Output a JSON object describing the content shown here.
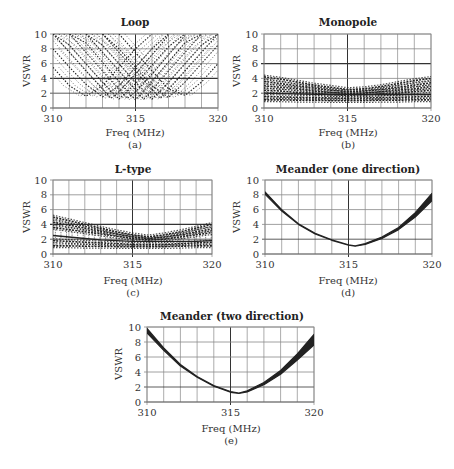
{
  "chart_data": [
    {
      "id": "a",
      "type": "line",
      "title": "Loop",
      "caption": "(a)",
      "xlabel": "Freq (MHz)",
      "ylabel": "VSWR",
      "xlim": [
        310,
        320
      ],
      "ylim": [
        0,
        10
      ],
      "xticks": [
        310,
        315,
        320
      ],
      "yticks": [
        0,
        2,
        4,
        6,
        8,
        10
      ],
      "grid": true,
      "style": "scatter-dashed",
      "description": "Many V-shaped VSWR curves with minima ~1-2 spread across 312-318 MHz, rising steeply to 10 at band edges",
      "series": [
        {
          "name": "min@312",
          "x": [
            310,
            311,
            312,
            313,
            314,
            315,
            316
          ],
          "y": [
            5.5,
            3.0,
            1.6,
            3.0,
            5.5,
            8.0,
            10
          ]
        },
        {
          "name": "min@313",
          "x": [
            310,
            311,
            312,
            313,
            314,
            315,
            316,
            317
          ],
          "y": [
            8.0,
            5.5,
            3.2,
            1.5,
            3.0,
            5.5,
            8.0,
            10
          ]
        },
        {
          "name": "min@313.5",
          "x": [
            310,
            311,
            312,
            313,
            313.5,
            314,
            315,
            316,
            317
          ],
          "y": [
            10,
            7.5,
            5.0,
            2.6,
            1.3,
            2.2,
            4.6,
            7.2,
            9.8
          ]
        },
        {
          "name": "min@314",
          "x": [
            310,
            311,
            312,
            313,
            314,
            315,
            316,
            317,
            318
          ],
          "y": [
            10,
            8.5,
            6.0,
            3.5,
            1.2,
            3.3,
            5.8,
            8.3,
            10
          ]
        },
        {
          "name": "min@314.5",
          "x": [
            311,
            312,
            313,
            314,
            314.5,
            315,
            316,
            317,
            318
          ],
          "y": [
            10,
            7.5,
            5.0,
            2.5,
            1.3,
            2.2,
            4.6,
            7.2,
            9.8
          ]
        },
        {
          "name": "min@315",
          "x": [
            311,
            312,
            313,
            314,
            315,
            316,
            317,
            318,
            319
          ],
          "y": [
            10,
            8.8,
            6.2,
            3.6,
            1.1,
            3.6,
            6.2,
            8.8,
            10
          ]
        },
        {
          "name": "min@315.5",
          "x": [
            312,
            313,
            314,
            315,
            315.5,
            316,
            317,
            318,
            319
          ],
          "y": [
            10,
            7.5,
            5.0,
            2.4,
            1.2,
            2.4,
            5.0,
            7.5,
            10
          ]
        },
        {
          "name": "min@316",
          "x": [
            312,
            313,
            314,
            315,
            316,
            317,
            318,
            319,
            320
          ],
          "y": [
            10,
            8.5,
            6.0,
            3.5,
            1.2,
            3.5,
            6.0,
            8.5,
            10
          ]
        },
        {
          "name": "min@316.5",
          "x": [
            313,
            314,
            315,
            316,
            316.5,
            317,
            318,
            319,
            320
          ],
          "y": [
            10,
            7.5,
            5.0,
            2.5,
            1.3,
            2.5,
            5.0,
            7.5,
            10
          ]
        },
        {
          "name": "min@317",
          "x": [
            313,
            314,
            315,
            316,
            317,
            318,
            319,
            320
          ],
          "y": [
            10,
            8.0,
            5.5,
            3.0,
            1.4,
            3.5,
            6.0,
            8.5
          ]
        },
        {
          "name": "min@318",
          "x": [
            314,
            315,
            316,
            317,
            318,
            319,
            320
          ],
          "y": [
            10,
            7.5,
            5.0,
            2.6,
            1.7,
            3.5,
            6.0
          ]
        }
      ]
    },
    {
      "id": "b",
      "type": "line",
      "title": "Monopole",
      "caption": "(b)",
      "xlabel": "Freq (MHz)",
      "ylabel": "VSWR",
      "xlim": [
        310,
        320
      ],
      "ylim": [
        0,
        10
      ],
      "xticks": [
        310,
        315,
        320
      ],
      "yticks": [
        0,
        2,
        4,
        6,
        8,
        10
      ],
      "grid": true,
      "style": "dashed-band",
      "description": "Band of nearly flat curves between ~1 and ~4.2, shallow minimum near 315 MHz",
      "series": [
        {
          "name": "upper",
          "x": [
            310,
            311,
            312,
            313,
            314,
            315,
            316,
            317,
            318,
            319,
            320
          ],
          "y": [
            4.2,
            3.9,
            3.5,
            3.1,
            2.8,
            2.5,
            2.6,
            2.9,
            3.3,
            3.7,
            4.0
          ]
        },
        {
          "name": "upper-mid",
          "x": [
            310,
            311,
            312,
            313,
            314,
            315,
            316,
            317,
            318,
            319,
            320
          ],
          "y": [
            3.6,
            3.3,
            3.0,
            2.7,
            2.4,
            2.2,
            2.3,
            2.5,
            2.8,
            3.1,
            3.4
          ]
        },
        {
          "name": "mid",
          "x": [
            310,
            311,
            312,
            313,
            314,
            315,
            316,
            317,
            318,
            319,
            320
          ],
          "y": [
            3.0,
            2.8,
            2.6,
            2.3,
            2.1,
            2.0,
            2.0,
            2.2,
            2.4,
            2.6,
            2.9
          ]
        },
        {
          "name": "mid-low",
          "x": [
            310,
            311,
            312,
            313,
            314,
            315,
            316,
            317,
            318,
            319,
            320
          ],
          "y": [
            2.4,
            2.3,
            2.1,
            2.0,
            1.8,
            1.7,
            1.8,
            1.9,
            2.0,
            2.2,
            2.4
          ]
        },
        {
          "name": "solid",
          "x": [
            310,
            311,
            312,
            313,
            314,
            315,
            316,
            317,
            318,
            319,
            320
          ],
          "y": [
            2.0,
            1.95,
            1.9,
            1.85,
            1.8,
            1.8,
            1.8,
            1.8,
            1.8,
            1.8,
            1.8
          ]
        },
        {
          "name": "low",
          "x": [
            310,
            311,
            312,
            313,
            314,
            315,
            316,
            317,
            318,
            319,
            320
          ],
          "y": [
            1.6,
            1.5,
            1.45,
            1.4,
            1.35,
            1.3,
            1.35,
            1.4,
            1.45,
            1.5,
            1.6
          ]
        },
        {
          "name": "lowest",
          "x": [
            310,
            311,
            312,
            313,
            314,
            315,
            316,
            317,
            318,
            319,
            320
          ],
          "y": [
            1.1,
            1.1,
            1.05,
            1.05,
            1.0,
            1.0,
            1.0,
            1.05,
            1.05,
            1.1,
            1.1
          ]
        }
      ]
    },
    {
      "id": "c",
      "type": "line",
      "title": "L-type",
      "caption": "(c)",
      "xlabel": "Freq (MHz)",
      "ylabel": "VSWR",
      "xlim": [
        310,
        320
      ],
      "ylim": [
        0,
        10
      ],
      "xticks": [
        310,
        315,
        320
      ],
      "yticks": [
        0,
        2,
        4,
        6,
        8,
        10
      ],
      "grid": true,
      "style": "dashed-band",
      "description": "Band of curves between ~1 and ~5, shallow minimum near 316 MHz",
      "series": [
        {
          "name": "upper",
          "x": [
            310,
            311,
            312,
            313,
            314,
            315,
            316,
            317,
            318,
            319,
            320
          ],
          "y": [
            5.0,
            4.5,
            4.0,
            3.5,
            3.0,
            2.6,
            2.3,
            2.6,
            3.0,
            3.5,
            4.0
          ]
        },
        {
          "name": "upper-mid",
          "x": [
            310,
            311,
            312,
            313,
            314,
            315,
            316,
            317,
            318,
            319,
            320
          ],
          "y": [
            4.3,
            3.9,
            3.5,
            3.1,
            2.7,
            2.3,
            2.1,
            2.3,
            2.6,
            3.0,
            3.4
          ]
        },
        {
          "name": "mid",
          "x": [
            310,
            311,
            312,
            313,
            314,
            315,
            316,
            317,
            318,
            319,
            320
          ],
          "y": [
            3.6,
            3.3,
            3.0,
            2.7,
            2.4,
            2.1,
            1.9,
            2.0,
            2.3,
            2.6,
            2.9
          ]
        },
        {
          "name": "solid",
          "x": [
            310,
            311,
            312,
            313,
            314,
            315,
            316,
            317,
            318,
            319,
            320
          ],
          "y": [
            2.5,
            2.3,
            2.1,
            1.9,
            1.8,
            1.7,
            1.7,
            1.7,
            1.7,
            1.7,
            1.8
          ]
        },
        {
          "name": "low",
          "x": [
            310,
            311,
            312,
            313,
            314,
            315,
            316,
            317,
            318,
            319,
            320
          ],
          "y": [
            1.8,
            1.7,
            1.6,
            1.5,
            1.4,
            1.3,
            1.3,
            1.3,
            1.4,
            1.5,
            1.6
          ]
        },
        {
          "name": "lowest",
          "x": [
            310,
            311,
            312,
            313,
            314,
            315,
            316,
            317,
            318,
            319,
            320
          ],
          "y": [
            1.1,
            1.1,
            1.05,
            1.05,
            1.0,
            1.0,
            1.0,
            1.0,
            1.05,
            1.1,
            1.1
          ]
        }
      ]
    },
    {
      "id": "d",
      "type": "line",
      "title": "Meander (one direction)",
      "caption": "(d)",
      "xlabel": "Freq (MHz)",
      "ylabel": "VSWR",
      "xlim": [
        310,
        320
      ],
      "ylim": [
        0,
        10
      ],
      "xticks": [
        310,
        315,
        320
      ],
      "yticks": [
        0,
        2,
        4,
        6,
        8,
        10
      ],
      "grid": true,
      "style": "tight-bundle",
      "description": "Tight bundle of curves, single V shape with minimum ~1.1 at ~315.4 MHz",
      "series": [
        {
          "name": "bundle-upper",
          "x": [
            310,
            311,
            312,
            313,
            314,
            315,
            315.4,
            316,
            317,
            318,
            319,
            320
          ],
          "y": [
            8.4,
            6.0,
            4.1,
            2.8,
            1.9,
            1.25,
            1.1,
            1.4,
            2.3,
            3.6,
            5.6,
            8.2
          ]
        },
        {
          "name": "bundle-lower",
          "x": [
            310,
            311,
            312,
            313,
            314,
            315,
            315.4,
            316,
            317,
            318,
            319,
            320
          ],
          "y": [
            8.1,
            5.8,
            4.0,
            2.7,
            1.85,
            1.2,
            1.05,
            1.3,
            2.1,
            3.3,
            5.0,
            7.2
          ]
        }
      ]
    },
    {
      "id": "e",
      "type": "line",
      "title": "Meander (two direction)",
      "caption": "(e)",
      "xlabel": "Freq (MHz)",
      "ylabel": "VSWR",
      "xlim": [
        310,
        320
      ],
      "ylim": [
        0,
        10
      ],
      "xticks": [
        310,
        315,
        320
      ],
      "yticks": [
        0,
        2,
        4,
        6,
        8,
        10
      ],
      "grid": true,
      "style": "tight-bundle",
      "description": "Tight bundle of curves with minimum ~1.2 at ~315.5 MHz, spreading wider at 320 MHz",
      "series": [
        {
          "name": "bundle-upper",
          "x": [
            310,
            311,
            312,
            313,
            314,
            315,
            315.5,
            316,
            317,
            318,
            319,
            320
          ],
          "y": [
            9.8,
            7.2,
            5.0,
            3.4,
            2.2,
            1.4,
            1.2,
            1.5,
            2.6,
            4.2,
            6.4,
            9.0
          ]
        },
        {
          "name": "bundle-lower",
          "x": [
            310,
            311,
            312,
            313,
            314,
            315,
            315.5,
            316,
            317,
            318,
            319,
            320
          ],
          "y": [
            9.2,
            6.9,
            4.8,
            3.3,
            2.1,
            1.3,
            1.15,
            1.35,
            2.3,
            3.7,
            5.6,
            7.6
          ]
        }
      ]
    }
  ],
  "labels": {
    "a": {
      "title": "Loop",
      "xlabel": "Freq (MHz)",
      "ylabel": "VSWR",
      "caption": "(a)"
    },
    "b": {
      "title": "Monopole",
      "xlabel": "Freq (MHz)",
      "ylabel": "VSWR",
      "caption": "(b)"
    },
    "c": {
      "title": "L-type",
      "xlabel": "Freq (MHz)",
      "ylabel": "VSWR",
      "caption": "(c)"
    },
    "d": {
      "title": "Meander (one direction)",
      "xlabel": "Freq (MHz)",
      "ylabel": "VSWR",
      "caption": "(d)"
    },
    "e": {
      "title": "Meander (two direction)",
      "xlabel": "Freq (MHz)",
      "ylabel": "VSWR",
      "caption": "(e)"
    }
  },
  "colors": {
    "grid": "#888888",
    "gridMajor": "#333333",
    "curve": "#222222",
    "text": "#333333"
  }
}
